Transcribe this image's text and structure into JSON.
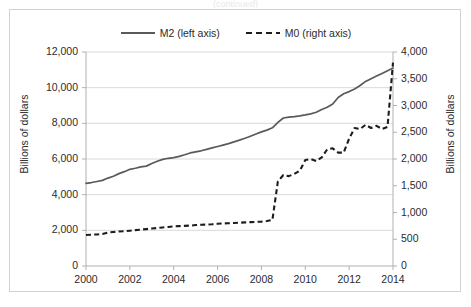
{
  "top_clip_text": "(continued)",
  "legend": {
    "position": "top-center",
    "entries": [
      {
        "label": "M2 (left axis)",
        "style": "solid",
        "swatch": "line-solid-swatch"
      },
      {
        "label": "M0 (right axis)",
        "style": "dashed",
        "swatch": "line-dashed-swatch"
      }
    ]
  },
  "axes": {
    "left": {
      "title": "Billions of dollars",
      "ticks": [
        "0",
        "2,000",
        "4,000",
        "6,000",
        "8,000",
        "10,000",
        "12,000"
      ],
      "min": 0,
      "max": 12000,
      "step": 2000
    },
    "right": {
      "title": "Billions of dollars",
      "ticks": [
        "0",
        "500",
        "1,000",
        "1,500",
        "2,000",
        "2,500",
        "3,000",
        "3,500",
        "4,000"
      ],
      "min": 0,
      "max": 4000,
      "step": 500
    },
    "x": {
      "title": "",
      "ticks": [
        "2000",
        "2002",
        "2004",
        "2006",
        "2008",
        "2010",
        "2012",
        "2014"
      ],
      "min": 2000,
      "max": 2014,
      "step": 2
    }
  },
  "colors": {
    "m2_line": "#5a5a5a",
    "m0_line": "#1d1d1d",
    "gridline": "#d9d9d9",
    "axis": "#b0b0b0",
    "frame": "#d2d2d2",
    "text": "#2b2b2b",
    "background": "#ffffff"
  },
  "chart_data": {
    "type": "line",
    "title": "",
    "subtitle": "",
    "xlabel": "",
    "ylabel": "Billions of dollars",
    "y2label": "Billions of dollars",
    "xlim": [
      2000,
      2014
    ],
    "ylim": [
      0,
      12000
    ],
    "y2lim": [
      0,
      4000
    ],
    "grid": true,
    "legend_position": "top-center",
    "x_tick_labels": [
      "2000",
      "2002",
      "2004",
      "2006",
      "2008",
      "2010",
      "2012",
      "2014"
    ],
    "y_tick_labels": [
      "0",
      "2,000",
      "4,000",
      "6,000",
      "8,000",
      "10,000",
      "12,000"
    ],
    "y2_tick_labels": [
      "0",
      "500",
      "1,000",
      "1,500",
      "2,000",
      "2,500",
      "3,000",
      "3,500",
      "4,000"
    ],
    "series": [
      {
        "name": "M2 (left axis)",
        "axis": "left",
        "style": "solid",
        "color": "#5a5a5a",
        "x": [
          2000.0,
          2000.25,
          2000.5,
          2000.75,
          2001.0,
          2001.25,
          2001.5,
          2001.75,
          2002.0,
          2002.25,
          2002.5,
          2002.75,
          2003.0,
          2003.25,
          2003.5,
          2003.75,
          2004.0,
          2004.25,
          2004.5,
          2004.75,
          2005.0,
          2005.25,
          2005.5,
          2005.75,
          2006.0,
          2006.25,
          2006.5,
          2006.75,
          2007.0,
          2007.25,
          2007.5,
          2007.75,
          2008.0,
          2008.25,
          2008.5,
          2008.75,
          2009.0,
          2009.25,
          2009.5,
          2009.75,
          2010.0,
          2010.25,
          2010.5,
          2010.75,
          2011.0,
          2011.25,
          2011.5,
          2011.75,
          2012.0,
          2012.25,
          2012.5,
          2012.75,
          2013.0,
          2013.25,
          2013.5,
          2013.75,
          2014.0
        ],
        "values": [
          4630,
          4680,
          4740,
          4800,
          4930,
          5030,
          5180,
          5290,
          5420,
          5480,
          5560,
          5600,
          5750,
          5870,
          5980,
          6040,
          6080,
          6150,
          6240,
          6340,
          6400,
          6460,
          6540,
          6620,
          6700,
          6780,
          6860,
          6960,
          7060,
          7160,
          7280,
          7400,
          7520,
          7620,
          7750,
          8050,
          8300,
          8350,
          8380,
          8420,
          8470,
          8530,
          8620,
          8780,
          8900,
          9080,
          9450,
          9660,
          9780,
          9930,
          10120,
          10350,
          10500,
          10650,
          10800,
          10950,
          11100
        ]
      },
      {
        "name": "M0 (right axis)",
        "axis": "right",
        "style": "dashed",
        "color": "#1d1d1d",
        "x": [
          2000.0,
          2000.25,
          2000.5,
          2000.75,
          2001.0,
          2001.25,
          2001.5,
          2001.75,
          2002.0,
          2002.25,
          2002.5,
          2002.75,
          2003.0,
          2003.25,
          2003.5,
          2003.75,
          2004.0,
          2004.25,
          2004.5,
          2004.75,
          2005.0,
          2005.25,
          2005.5,
          2005.75,
          2006.0,
          2006.25,
          2006.5,
          2006.75,
          2007.0,
          2007.25,
          2007.5,
          2007.75,
          2008.0,
          2008.25,
          2008.5,
          2008.75,
          2009.0,
          2009.25,
          2009.5,
          2009.75,
          2010.0,
          2010.25,
          2010.5,
          2010.75,
          2011.0,
          2011.25,
          2011.5,
          2011.75,
          2012.0,
          2012.25,
          2012.5,
          2012.75,
          2013.0,
          2013.25,
          2013.5,
          2013.75,
          2014.0
        ],
        "values": [
          580,
          585,
          590,
          600,
          625,
          635,
          645,
          650,
          660,
          670,
          680,
          690,
          700,
          710,
          720,
          730,
          740,
          745,
          750,
          755,
          765,
          770,
          775,
          780,
          790,
          795,
          800,
          805,
          810,
          815,
          820,
          825,
          830,
          840,
          860,
          1580,
          1700,
          1680,
          1720,
          1780,
          1980,
          2000,
          1960,
          2030,
          2180,
          2200,
          2120,
          2120,
          2380,
          2580,
          2560,
          2640,
          2580,
          2620,
          2560,
          2600,
          3800
        ]
      }
    ]
  }
}
